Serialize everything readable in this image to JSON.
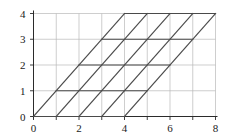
{
  "figure": {
    "title": "",
    "background_color": "#ffffff",
    "grid_color": "#b9b9b9",
    "axis_color": "#2b2b2b",
    "lattice_color": "#4a4a4a"
  },
  "chart_data": {
    "type": "line",
    "title": "",
    "xlabel": "",
    "ylabel": "",
    "xlim": [
      0,
      8
    ],
    "ylim": [
      0,
      4
    ],
    "grid": true,
    "legend": null,
    "x_ticks": [
      0,
      1,
      2,
      3,
      4,
      5,
      6,
      7,
      8
    ],
    "x_tick_labels": [
      "0",
      "",
      "2",
      "",
      "4",
      "",
      "6",
      "",
      "8"
    ],
    "y_ticks": [
      0,
      1,
      2,
      3,
      4
    ],
    "y_tick_labels": [
      "0",
      "1",
      "2",
      "3",
      "4"
    ],
    "series": [
      {
        "name": "lattice-horizontal-y0",
        "type": "segment",
        "x": [
          0,
          4
        ],
        "y": [
          0,
          0
        ]
      },
      {
        "name": "lattice-horizontal-y1",
        "type": "segment",
        "x": [
          1,
          5
        ],
        "y": [
          1,
          1
        ]
      },
      {
        "name": "lattice-horizontal-y2",
        "type": "segment",
        "x": [
          2,
          6
        ],
        "y": [
          2,
          2
        ]
      },
      {
        "name": "lattice-horizontal-y3",
        "type": "segment",
        "x": [
          3,
          7
        ],
        "y": [
          3,
          3
        ]
      },
      {
        "name": "lattice-horizontal-y4",
        "type": "segment",
        "x": [
          4,
          8
        ],
        "y": [
          4,
          4
        ]
      },
      {
        "name": "lattice-diagonal-0",
        "type": "segment",
        "x": [
          0,
          4
        ],
        "y": [
          0,
          4
        ]
      },
      {
        "name": "lattice-diagonal-1",
        "type": "segment",
        "x": [
          1,
          5
        ],
        "y": [
          0,
          4
        ]
      },
      {
        "name": "lattice-diagonal-2",
        "type": "segment",
        "x": [
          2,
          6
        ],
        "y": [
          0,
          4
        ]
      },
      {
        "name": "lattice-diagonal-3",
        "type": "segment",
        "x": [
          3,
          7
        ],
        "y": [
          0,
          4
        ]
      },
      {
        "name": "lattice-diagonal-4",
        "type": "segment",
        "x": [
          4,
          8
        ],
        "y": [
          0,
          4
        ]
      }
    ],
    "grid_x_lines": [
      0,
      1,
      2,
      3,
      4,
      5,
      6,
      7,
      8
    ],
    "grid_y_lines": [
      0,
      1,
      2,
      3,
      4
    ]
  }
}
